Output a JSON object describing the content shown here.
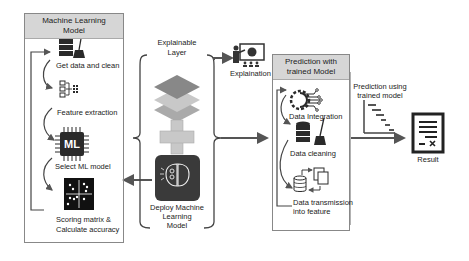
{
  "ml_panel": {
    "title": "Machine Learning Model",
    "title_line1": "Machine Learning",
    "title_line2": "Model",
    "steps": [
      {
        "label": "Get data and clean",
        "icon": "database-broom-icon"
      },
      {
        "label": "Feature extraction",
        "icon": "feature-tree-icon"
      },
      {
        "label": "Select ML model",
        "icon": "ml-chip-icon",
        "chip_text": "ML"
      },
      {
        "label_line1": "Scoring matrix &",
        "label_line2": "Calculate accuracy",
        "icon": "scatter-matrix-icon"
      }
    ]
  },
  "explainable": {
    "title_line1": "Explainable",
    "title_line2": "Layer",
    "deploy_line1": "Deploy Machine",
    "deploy_line2": "Learning",
    "deploy_line3": "Model",
    "explanation_label": "Explaination"
  },
  "prediction_panel": {
    "title_line1": "Prediction with",
    "title_line2": "trained Model",
    "steps": [
      {
        "label": "Data Integration",
        "icon": "gear-circuit-icon"
      },
      {
        "label": "Data cleaning",
        "icon": "database-broom-icon"
      },
      {
        "label_line1": "Data transmission",
        "label_line2": "into feature",
        "icon": "database-transfer-icon"
      }
    ]
  },
  "output": {
    "prediction_line1": "Prediction using",
    "prediction_line2": "trained model",
    "result_label": "Result"
  },
  "colors": {
    "header_bg": "#d6d6d6",
    "arrow": "#555555",
    "icon_dark": "#2a2a2a",
    "layer_dark": "#8a8a8a",
    "layer_light": "#c4c4c4",
    "plus": "#c8c8c8",
    "brain_bg": "#3a3a3a"
  }
}
